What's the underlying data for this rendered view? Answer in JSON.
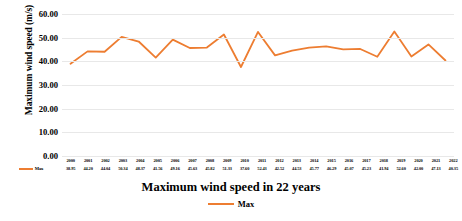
{
  "chart_data": {
    "type": "line",
    "title": "Maximum wind speed in 22 years",
    "xlabel": "",
    "ylabel": "Maximum wind speed (m/s)",
    "ylim": [
      0,
      60
    ],
    "ytick_labels": [
      "60.00",
      "50.00",
      "40.00",
      "30.00",
      "20.00",
      "10.00",
      "0.00"
    ],
    "ytick_values": [
      60,
      50,
      40,
      30,
      20,
      10,
      0
    ],
    "grid": true,
    "legend_position": "bottom",
    "categories": [
      "2000",
      "2001",
      "2002",
      "2003",
      "2004",
      "2005",
      "2006",
      "2007",
      "2008",
      "2009",
      "2010",
      "2011",
      "2012",
      "2013",
      "2014",
      "2015",
      "2016",
      "2017",
      "2018",
      "2019",
      "2020",
      "2021",
      "2022"
    ],
    "series": [
      {
        "name": "Max",
        "color": "#ED7D31",
        "values": [
          38.95,
          44.2,
          44.04,
          50.34,
          48.37,
          41.56,
          49.16,
          45.63,
          45.82,
          51.33,
          37.6,
          52.43,
          42.52,
          44.53,
          45.77,
          46.29,
          45.07,
          45.23,
          41.94,
          52.6,
          42.0,
          47.13,
          40.35
        ],
        "value_labels": [
          "38.95",
          "44.20",
          "44.04",
          "50.34",
          "48.37",
          "41.56",
          "49.16",
          "45.63",
          "45.82",
          "51.33",
          "37.60",
          "52.43",
          "42.52",
          "44.53",
          "45.77",
          "46.29",
          "45.07",
          "45.23",
          "41.94",
          "52.60",
          "42.00",
          "47.13",
          "40.35"
        ]
      }
    ]
  },
  "legend": {
    "series_label": "Max"
  },
  "table": {
    "row_label": "Max"
  }
}
